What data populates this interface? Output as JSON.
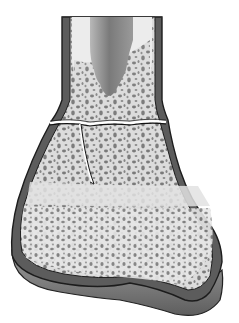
{
  "figure": {
    "alt": "Illustration of distal bone with fracture line through cancellous bone",
    "colors": {
      "background": "#ffffff",
      "cortex_dark": "#5a5a5a",
      "cortex_outline": "#1e1e1e",
      "cancellous_fill": "#dedede",
      "trabecular_spots": "#7a7a7a",
      "medullary_canal_light": "#bdbdbd",
      "medullary_canal_dark": "#6e6e6e",
      "fracture_line": "#222222",
      "articular_cartilage": "#8a8a8a"
    }
  }
}
